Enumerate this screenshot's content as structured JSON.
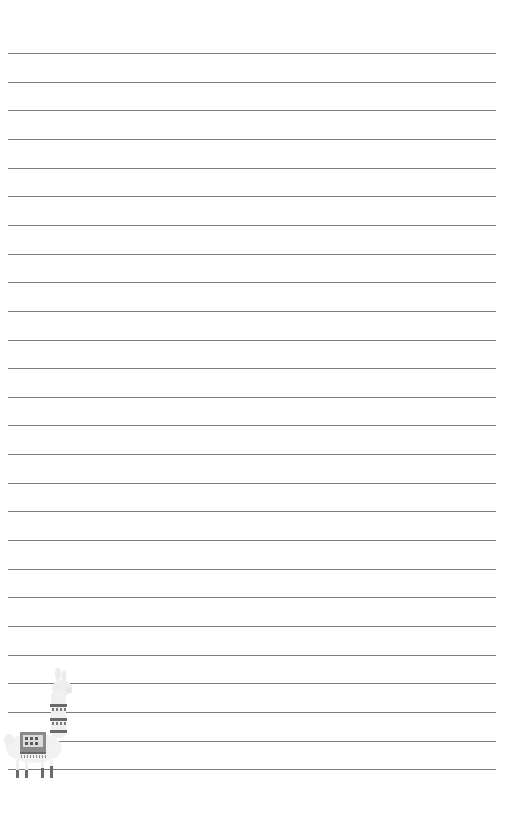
{
  "page": {
    "type": "lined-notepaper",
    "background_color": "#ffffff",
    "line_color": "#7d7d7d",
    "line_count": 26,
    "first_line_y": 53,
    "line_spacing": 28.65,
    "line_left": 8,
    "line_right": 496
  },
  "illustration": {
    "name": "llama-icon",
    "colors": {
      "body": "#f2f2f2",
      "blanket": "#8a8a8a",
      "pattern": "#5a5a5a",
      "legs": "#6a6a6a"
    }
  }
}
